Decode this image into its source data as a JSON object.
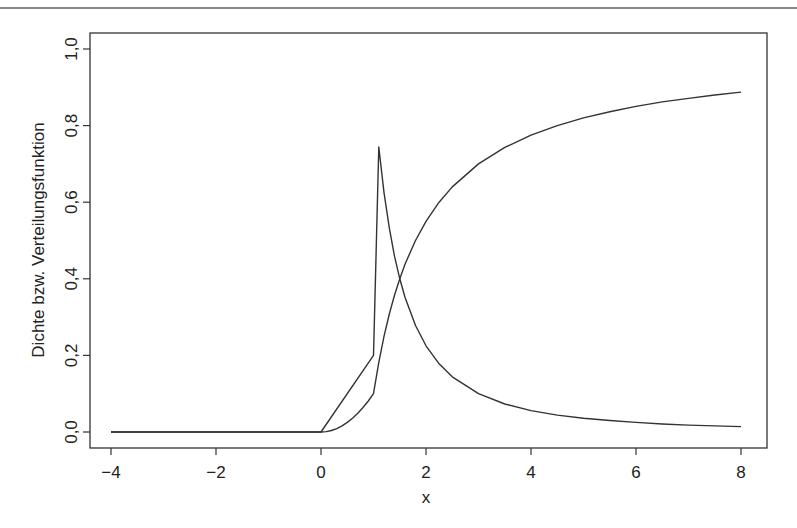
{
  "chart_data": {
    "type": "line",
    "title": "",
    "xlabel": "x",
    "ylabel": "Dichte bzw. Verteilungsfunktion",
    "xlim": [
      -4,
      8
    ],
    "ylim": [
      0,
      1.0
    ],
    "x_ticks": [
      -4,
      -2,
      0,
      2,
      4,
      6,
      8
    ],
    "x_tick_labels": [
      "-4",
      "-2",
      "0",
      "2",
      "4",
      "6",
      "8"
    ],
    "y_ticks": [
      0,
      0.2,
      0.4,
      0.6,
      0.8,
      1.0
    ],
    "y_tick_labels": [
      "0,0",
      "0,2",
      "0,4",
      "0,6",
      "0,8",
      "1,0"
    ],
    "grid": false,
    "legend": null,
    "line_color": "#333333",
    "series": [
      {
        "name": "Dichte",
        "points": [
          [
            -4,
            0
          ],
          [
            0,
            0
          ],
          [
            1,
            0.2
          ],
          [
            1.1,
            0.744
          ],
          [
            1.2,
            0.625
          ],
          [
            1.3,
            0.533
          ],
          [
            1.4,
            0.459
          ],
          [
            1.5,
            0.4
          ],
          [
            1.6,
            0.352
          ],
          [
            1.8,
            0.278
          ],
          [
            2,
            0.225
          ],
          [
            2.25,
            0.178
          ],
          [
            2.5,
            0.144
          ],
          [
            3,
            0.1
          ],
          [
            3.5,
            0.073
          ],
          [
            4,
            0.056
          ],
          [
            4.5,
            0.044
          ],
          [
            5,
            0.036
          ],
          [
            5.5,
            0.03
          ],
          [
            6,
            0.025
          ],
          [
            6.5,
            0.021
          ],
          [
            7,
            0.018
          ],
          [
            7.5,
            0.016
          ],
          [
            8,
            0.014
          ]
        ]
      },
      {
        "name": "Verteilungsfunktion",
        "points": [
          [
            -4,
            0
          ],
          [
            0,
            0
          ],
          [
            0.1,
            0.001
          ],
          [
            0.2,
            0.004
          ],
          [
            0.3,
            0.009
          ],
          [
            0.4,
            0.016
          ],
          [
            0.5,
            0.025
          ],
          [
            0.6,
            0.036
          ],
          [
            0.7,
            0.049
          ],
          [
            0.8,
            0.064
          ],
          [
            0.9,
            0.081
          ],
          [
            1,
            0.1
          ],
          [
            1.1,
            0.182
          ],
          [
            1.2,
            0.25
          ],
          [
            1.3,
            0.308
          ],
          [
            1.4,
            0.357
          ],
          [
            1.5,
            0.4
          ],
          [
            1.6,
            0.438
          ],
          [
            1.8,
            0.5
          ],
          [
            2,
            0.55
          ],
          [
            2.25,
            0.6
          ],
          [
            2.5,
            0.64
          ],
          [
            3,
            0.7
          ],
          [
            3.5,
            0.743
          ],
          [
            4,
            0.775
          ],
          [
            4.5,
            0.8
          ],
          [
            5,
            0.82
          ],
          [
            5.5,
            0.836
          ],
          [
            6,
            0.85
          ],
          [
            6.5,
            0.862
          ],
          [
            7,
            0.871
          ],
          [
            7.5,
            0.88
          ],
          [
            8,
            0.8875
          ]
        ]
      }
    ]
  }
}
